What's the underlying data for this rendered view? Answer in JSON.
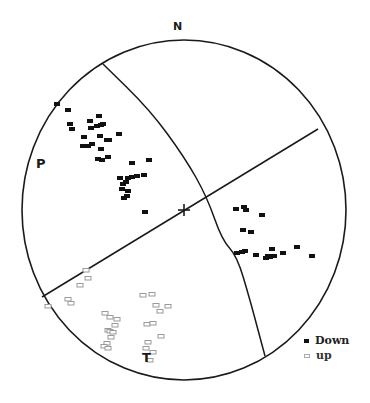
{
  "labels": {
    "north": "N",
    "p_axis": "P",
    "t_axis": "T"
  },
  "legend": {
    "items": [
      {
        "label": "Down",
        "style": "filled"
      },
      {
        "label": "up",
        "style": "open"
      }
    ]
  },
  "colors": {
    "line": "#1a1a1a",
    "down": "#111111",
    "up_stroke": "#9a9a9a",
    "background": "#ffffff"
  },
  "chart_data": {
    "type": "scatter",
    "title": "",
    "projection": "stereonet (lower hemisphere)",
    "primitive_circle": {
      "cx": 184,
      "cy": 210,
      "rx": 162,
      "ry": 170
    },
    "center_mark": {
      "x": 184,
      "y": 210,
      "symbol": "+"
    },
    "nodal_planes": [
      {
        "type": "great_circle_arc",
        "points": [
          [
            103,
            64
          ],
          [
            150,
            110
          ],
          [
            185,
            158
          ],
          [
            207,
            197
          ],
          [
            222,
            240
          ],
          [
            237,
            256
          ],
          [
            250,
            300
          ],
          [
            258,
            330
          ],
          [
            265,
            356
          ]
        ]
      },
      {
        "type": "straight_line",
        "points": [
          [
            42,
            297
          ],
          [
            318,
            129
          ]
        ]
      }
    ],
    "axes_labels": [
      {
        "text": "P",
        "x": 41,
        "y": 163
      },
      {
        "text": "T",
        "x": 147,
        "y": 358
      },
      {
        "text": "N",
        "x": 178,
        "y": 28
      }
    ],
    "series": [
      {
        "name": "Down",
        "marker": "filled-rect",
        "points": [
          [
            57,
            104
          ],
          [
            68,
            110
          ],
          [
            70,
            124
          ],
          [
            72,
            129
          ],
          [
            84,
            137
          ],
          [
            85,
            146
          ],
          [
            83,
            146
          ],
          [
            90,
            121
          ],
          [
            91,
            128
          ],
          [
            97,
            126
          ],
          [
            99,
            116
          ],
          [
            101,
            125
          ],
          [
            103,
            124
          ],
          [
            100,
            136
          ],
          [
            101,
            149
          ],
          [
            107,
            140
          ],
          [
            109,
            140
          ],
          [
            108,
            157
          ],
          [
            92,
            144
          ],
          [
            88,
            146
          ],
          [
            98,
            159
          ],
          [
            102,
            160
          ],
          [
            119,
            134
          ],
          [
            132,
            163
          ],
          [
            149,
            160
          ],
          [
            144,
            175
          ],
          [
            126,
            182
          ],
          [
            128,
            178
          ],
          [
            132,
            177
          ],
          [
            137,
            176
          ],
          [
            120,
            178
          ],
          [
            123,
            184
          ],
          [
            122,
            189
          ],
          [
            128,
            191
          ],
          [
            127,
            196
          ],
          [
            124,
            198
          ],
          [
            145,
            212
          ],
          [
            236,
            209
          ],
          [
            244,
            207
          ],
          [
            246,
            210
          ],
          [
            262,
            215
          ],
          [
            243,
            230
          ],
          [
            251,
            232
          ],
          [
            237,
            253
          ],
          [
            242,
            252
          ],
          [
            245,
            251
          ],
          [
            256,
            255
          ],
          [
            266,
            258
          ],
          [
            268,
            256
          ],
          [
            270,
            257
          ],
          [
            274,
            256
          ],
          [
            272,
            249
          ],
          [
            283,
            253
          ],
          [
            297,
            247
          ],
          [
            312,
            256
          ]
        ]
      },
      {
        "name": "up",
        "marker": "open-rect",
        "points": [
          [
            86,
            270
          ],
          [
            88,
            278
          ],
          [
            80,
            285
          ],
          [
            68,
            299
          ],
          [
            71,
            303
          ],
          [
            48,
            306
          ],
          [
            105,
            313
          ],
          [
            110,
            317
          ],
          [
            117,
            319
          ],
          [
            115,
            325
          ],
          [
            108,
            330
          ],
          [
            110,
            331
          ],
          [
            113,
            332
          ],
          [
            111,
            337
          ],
          [
            107,
            343
          ],
          [
            104,
            346
          ],
          [
            108,
            348
          ],
          [
            143,
            295
          ],
          [
            152,
            294
          ],
          [
            156,
            305
          ],
          [
            160,
            311
          ],
          [
            168,
            306
          ],
          [
            147,
            324
          ],
          [
            153,
            323
          ],
          [
            161,
            336
          ],
          [
            148,
            342
          ],
          [
            146,
            348
          ],
          [
            153,
            352
          ],
          [
            150,
            360
          ]
        ]
      }
    ],
    "legend": {
      "position": "bottom-right",
      "entries": [
        "Down",
        "up"
      ]
    }
  }
}
